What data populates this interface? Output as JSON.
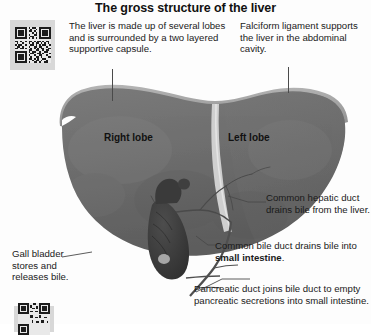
{
  "figure": {
    "title": "The gross structure of the liver"
  },
  "codes": {
    "top": {
      "name": "qr-code",
      "label": "QR code"
    },
    "bottom": {
      "name": "qr-code-partial",
      "label": "QR code"
    }
  },
  "notes": {
    "lobes": "The liver is made up of several lobes and is surrounded by a two layered supportive capsule.",
    "falciform": "Falciform ligament supports the liver in the abdominal cavity.",
    "hepatic_duct": "Common hepatic duct drains bile from the liver.",
    "bile_duct_prefix": "Common bile duct drains bile into ",
    "bile_duct_emphasis": "small intestine",
    "bile_duct_suffix": ".",
    "pancreatic_duct": "Pancreatic duct joins bile duct to empty pancreatic secretions into small intestine.",
    "gall_bladder": "Gall bladder stores and releases bile."
  },
  "organ_labels": {
    "right_lobe": "Right lobe",
    "left_lobe": "Left lobe"
  },
  "colors": {
    "background": "#fdfdfd",
    "title_text": "#111111",
    "body_text": "#1a1a1a",
    "liver_body": "#6f6f6f",
    "liver_body_dark": "#5e5e5e",
    "liver_capsule": "#9a9a9a",
    "falciform": "#c9c9c9",
    "gall_bladder": "#3a3a3a",
    "duct": "#4f4f4f",
    "leader_line": "#4a4a4a",
    "qr_background": "#d8d8d8",
    "qr_modules": "#1c1c1c"
  }
}
